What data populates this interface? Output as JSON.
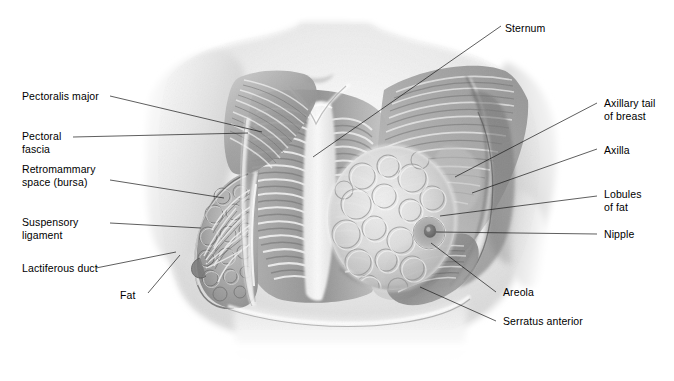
{
  "figure": {
    "width": 674,
    "height": 381,
    "background_color": "#ffffff",
    "line_color": "#1a1a1a",
    "text_color": "#000000"
  },
  "labels": {
    "pectoralis_major": "Pectoralis major",
    "pectoral_fascia_line1": "Pectoral",
    "pectoral_fascia_line2": "fascia",
    "retromammary_line1": "Retromammary",
    "retromammary_line2": "space (bursa)",
    "suspensory_line1": "Suspensory",
    "suspensory_line2": "ligament",
    "lactiferous_duct": "Lactiferous duct",
    "fat": "Fat",
    "sternum": "Sternum",
    "axillary_tail_line1": "Axillary tail",
    "axillary_tail_line2": "of breast",
    "axilla": "Axilla",
    "lobules_line1": "Lobules",
    "lobules_line2": "of fat",
    "nipple": "Nipple",
    "areola": "Areola",
    "serratus_anterior": "Serratus anterior"
  },
  "illustration": {
    "description": "Grayscale pencil-style anatomical illustration of a female torso. The right side of the image (viewer left) shows a sagittal cut of the breast exposing fat, lactiferous ducts and suspensory ligaments; the centre shows the sternum, ribs and intercostal musculature; the viewer-right side shows the intact breast with nipple and areola over the pectoralis major and serratus anterior.",
    "tone_light": "#f3f3f3",
    "tone_mid": "#b9b9b9",
    "tone_dark": "#6f6f6f",
    "tone_darkest": "#444444"
  }
}
